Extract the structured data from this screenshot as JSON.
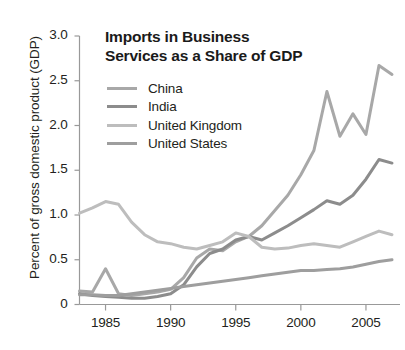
{
  "chart_data": {
    "type": "line",
    "title": "Imports in Business Services as a Share of GDP",
    "title_line1": "Imports in Business",
    "title_line2": "Services as a Share of GDP",
    "xlabel": "",
    "ylabel": "Percent of gross domestic product (GDP)",
    "xlim": [
      1983,
      2007
    ],
    "ylim": [
      0,
      3.0
    ],
    "ytick_labels": [
      "3.0",
      "2.5",
      "2.0",
      "1.5",
      "1.0",
      "0.5",
      "0"
    ],
    "ytick_values": [
      3.0,
      2.5,
      2.0,
      1.5,
      1.0,
      0.5,
      0
    ],
    "xtick_labels": [
      "1985",
      "1990",
      "1995",
      "2000",
      "2005"
    ],
    "xtick_values": [
      1985,
      1990,
      1995,
      2000,
      2005
    ],
    "grid": false,
    "legend_position": "top-left-inside",
    "x": [
      1983,
      1984,
      1985,
      1986,
      1987,
      1988,
      1989,
      1990,
      1991,
      1992,
      1993,
      1994,
      1995,
      1996,
      1997,
      1998,
      1999,
      2000,
      2001,
      2002,
      2003,
      2004,
      2005,
      2006,
      2007
    ],
    "series": [
      {
        "name": "China",
        "color": "#a8a8a8",
        "values": [
          0.15,
          0.14,
          0.4,
          0.12,
          0.1,
          0.12,
          0.14,
          0.17,
          0.3,
          0.52,
          0.62,
          0.6,
          0.7,
          0.76,
          0.88,
          1.05,
          1.22,
          1.45,
          1.72,
          2.38,
          1.88,
          2.13,
          1.9,
          2.67,
          2.57
        ]
      },
      {
        "name": "India",
        "color": "#8c8c8c",
        "values": [
          0.12,
          0.1,
          0.09,
          0.08,
          0.07,
          0.07,
          0.09,
          0.12,
          0.22,
          0.42,
          0.57,
          0.62,
          0.72,
          0.76,
          0.72,
          0.8,
          0.88,
          0.97,
          1.06,
          1.16,
          1.12,
          1.22,
          1.4,
          1.62,
          1.58
        ]
      },
      {
        "name": "United Kingdom",
        "color": "#bdbdbd",
        "values": [
          1.02,
          1.08,
          1.15,
          1.12,
          0.92,
          0.78,
          0.7,
          0.68,
          0.64,
          0.62,
          0.66,
          0.7,
          0.8,
          0.76,
          0.64,
          0.62,
          0.63,
          0.66,
          0.68,
          0.66,
          0.64,
          0.7,
          0.76,
          0.82,
          0.78
        ]
      },
      {
        "name": "United States",
        "color": "#9e9e9e",
        "values": [
          0.11,
          0.11,
          0.1,
          0.1,
          0.12,
          0.14,
          0.16,
          0.18,
          0.2,
          0.22,
          0.24,
          0.26,
          0.28,
          0.3,
          0.32,
          0.34,
          0.36,
          0.38,
          0.38,
          0.39,
          0.4,
          0.42,
          0.45,
          0.48,
          0.5
        ]
      }
    ]
  },
  "axis": {
    "axis_color": "#999999",
    "tick_color": "#999999"
  }
}
